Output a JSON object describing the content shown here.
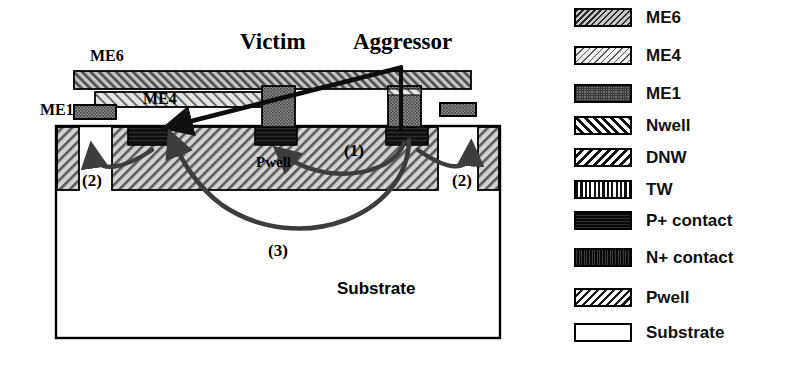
{
  "diagram": {
    "title_labels": {
      "victim": "Victim",
      "aggressor": "Aggressor"
    },
    "layer_labels": {
      "me6": "ME6",
      "me4": "ME4",
      "me1": "ME1",
      "pwell": "Pwell",
      "substrate": "Substrate"
    },
    "path_labels": {
      "path1": "(1)",
      "path2_left": "(2)",
      "path2_right": "(2)",
      "path3": "(3)"
    },
    "coupling_paths": [
      {
        "id": "1",
        "label": "(1)",
        "description": "lateral surface coupling through Pwell from aggressor contact to victim contact"
      },
      {
        "id": "2",
        "label": "(2)",
        "description": "local coupling from contact up into adjacent guard-ring Pwell strip"
      },
      {
        "id": "3",
        "label": "(3)",
        "description": "deep bulk coupling arc through the substrate from aggressor to far-left contact"
      }
    ],
    "colors": {
      "outline": "#000000",
      "metal_fill": "#b4b4b4",
      "pwell_fill": "#c8c8c8",
      "contact_fill": "#1a1a1a",
      "arrow": "#3d3d3d",
      "substrate_fill": "#ffffff"
    }
  },
  "legend": {
    "items": [
      {
        "label": "ME6",
        "pattern": "diagonal-hatch-dark",
        "swatch_class": "sw-me6"
      },
      {
        "label": "ME4",
        "pattern": "diagonal-hatch-light",
        "swatch_class": "sw-me4"
      },
      {
        "label": "ME1",
        "pattern": "stipple",
        "swatch_class": "sw-me1"
      },
      {
        "label": "Nwell",
        "pattern": "forward-slash-hatch",
        "swatch_class": "sw-nwell"
      },
      {
        "label": "DNW",
        "pattern": "back-slash-hatch",
        "swatch_class": "sw-dnw"
      },
      {
        "label": "TW",
        "pattern": "vertical-lines",
        "swatch_class": "sw-tw"
      },
      {
        "label": "P+ contact",
        "pattern": "solid-dark",
        "swatch_class": "sw-pcontact"
      },
      {
        "label": "N+ contact",
        "pattern": "dark-texture",
        "swatch_class": "sw-ncontact"
      },
      {
        "label": "Pwell",
        "pattern": "white-diagonal-hatch",
        "swatch_class": "sw-pwell"
      },
      {
        "label": "Substrate",
        "pattern": "empty",
        "swatch_class": "sw-substrate"
      }
    ]
  }
}
